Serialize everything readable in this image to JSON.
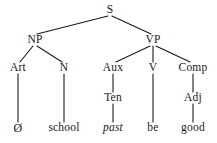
{
  "figure": {
    "type": "syntax-tree",
    "background_color": "#ffffff",
    "line_color": "#1a1a1a",
    "text_color": "#1a1a1a"
  },
  "nodes": {
    "s": {
      "label": "S",
      "x": 110,
      "y": 10
    },
    "np": {
      "label": "NP",
      "x": 35,
      "y": 40
    },
    "vp": {
      "label": "VP",
      "x": 153,
      "y": 40
    },
    "art": {
      "label": "Art",
      "x": 18,
      "y": 68
    },
    "n": {
      "label": "N",
      "x": 64,
      "y": 68
    },
    "aux": {
      "label": "Aux",
      "x": 113,
      "y": 68
    },
    "v": {
      "label": "V",
      "x": 153,
      "y": 68
    },
    "comp": {
      "label": "Comp",
      "x": 193,
      "y": 68
    },
    "ten": {
      "label": "Ten",
      "x": 113,
      "y": 98
    },
    "adj": {
      "label": "Adj",
      "x": 193,
      "y": 98
    }
  },
  "leaves": {
    "art_word": {
      "label": "Ø",
      "x": 18,
      "y": 128,
      "italic": false
    },
    "n_word": {
      "label": "school",
      "x": 64,
      "y": 128,
      "italic": false
    },
    "ten_word": {
      "label": "past",
      "x": 113,
      "y": 128,
      "italic": true
    },
    "v_word": {
      "label": "be",
      "x": 153,
      "y": 128,
      "italic": false
    },
    "adj_word": {
      "label": "good",
      "x": 193,
      "y": 128,
      "italic": false
    }
  },
  "edges": [
    {
      "from": "s",
      "to": "np",
      "x1": 108,
      "y1": 16,
      "x2": 37,
      "y2": 34
    },
    {
      "from": "s",
      "to": "vp",
      "x1": 112,
      "y1": 16,
      "x2": 151,
      "y2": 34
    },
    {
      "from": "np",
      "to": "art",
      "x1": 33,
      "y1": 46,
      "x2": 20,
      "y2": 62
    },
    {
      "from": "np",
      "to": "n",
      "x1": 37,
      "y1": 46,
      "x2": 62,
      "y2": 62
    },
    {
      "from": "vp",
      "to": "aux",
      "x1": 150,
      "y1": 46,
      "x2": 116,
      "y2": 62
    },
    {
      "from": "vp",
      "to": "v",
      "x1": 153,
      "y1": 46,
      "x2": 153,
      "y2": 62
    },
    {
      "from": "vp",
      "to": "comp",
      "x1": 156,
      "y1": 46,
      "x2": 190,
      "y2": 62
    },
    {
      "from": "art",
      "to": "art_word",
      "x1": 18,
      "y1": 74,
      "x2": 18,
      "y2": 122
    },
    {
      "from": "n",
      "to": "n_word",
      "x1": 64,
      "y1": 74,
      "x2": 64,
      "y2": 122
    },
    {
      "from": "aux",
      "to": "ten",
      "x1": 113,
      "y1": 74,
      "x2": 113,
      "y2": 92
    },
    {
      "from": "v",
      "to": "v_word",
      "x1": 153,
      "y1": 74,
      "x2": 153,
      "y2": 122
    },
    {
      "from": "comp",
      "to": "adj",
      "x1": 193,
      "y1": 74,
      "x2": 193,
      "y2": 92
    },
    {
      "from": "ten",
      "to": "ten_word",
      "x1": 113,
      "y1": 104,
      "x2": 113,
      "y2": 122
    },
    {
      "from": "adj",
      "to": "adj_word",
      "x1": 193,
      "y1": 104,
      "x2": 193,
      "y2": 122
    }
  ]
}
